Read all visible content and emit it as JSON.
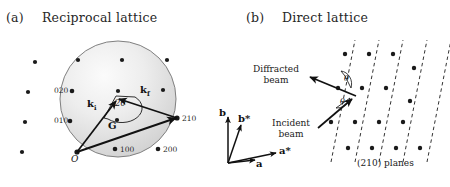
{
  "figure": {
    "width": 450,
    "height": 187,
    "background": "#ffffff"
  },
  "panel_a": {
    "tag": "(a)",
    "title": "Reciprocal lattice",
    "sphere": {
      "cx": 118,
      "cy": 99,
      "r": 58,
      "fill_light": "#f2f2f2",
      "fill_dark": "#d2d2d2",
      "stroke": "#7a7a7a"
    },
    "origin_label": "O",
    "point_labels": [
      {
        "text": "020",
        "x": 54,
        "y": 75
      },
      {
        "text": "010",
        "x": 54,
        "y": 106
      },
      {
        "text": "210",
        "x": 182,
        "y": 115
      },
      {
        "text": "100",
        "x": 120,
        "y": 148
      },
      {
        "text": "200",
        "x": 163,
        "y": 148
      }
    ],
    "vectors": [
      {
        "name": "k_i",
        "label": "k",
        "sub": "i",
        "x": 86,
        "y": 99
      },
      {
        "name": "k_f",
        "label": "k",
        "sub": "f",
        "x": 142,
        "y": 88
      },
      {
        "name": "G",
        "label": "G",
        "sub": "",
        "x": 111,
        "y": 122
      }
    ],
    "angle_label": "2θ",
    "lattice_dot_color": "#1a1a1a",
    "vector_color": "#111111"
  },
  "panel_b": {
    "tag": "(b)",
    "title": "Direct lattice",
    "axes": [
      {
        "name": "b",
        "label": "b",
        "star": false,
        "x": 223,
        "y": 113
      },
      {
        "name": "b-star",
        "label": "b",
        "star": true,
        "x": 239,
        "y": 117
      },
      {
        "name": "a-star",
        "label": "a",
        "star": true,
        "x": 278,
        "y": 151
      },
      {
        "name": "a",
        "label": "a",
        "star": false,
        "x": 256,
        "y": 163
      }
    ],
    "diffracted_beam_label": [
      "Diffracted",
      "beam"
    ],
    "incident_beam_label": [
      "Incident",
      "beam"
    ],
    "angle_label": "θ",
    "planes_label": "(210) planes",
    "plane_color": "#333333",
    "lattice_dot_color": "#1a1a1a"
  }
}
